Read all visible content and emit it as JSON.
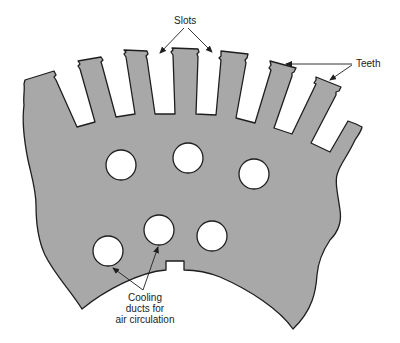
{
  "diagram": {
    "colors": {
      "lamination_fill": "#a8a8a8",
      "outline": "#1e1e1e",
      "background": "#ffffff",
      "text": "#222222"
    },
    "labels": {
      "slots": "Slots",
      "teeth": "Teeth",
      "cooling_line1": "Cooling",
      "cooling_line2": "ducts for",
      "cooling_line3": "air circulation"
    },
    "teeth_count_visible": 8,
    "slots_count_visible": 7,
    "cooling_ducts_count": 6
  }
}
